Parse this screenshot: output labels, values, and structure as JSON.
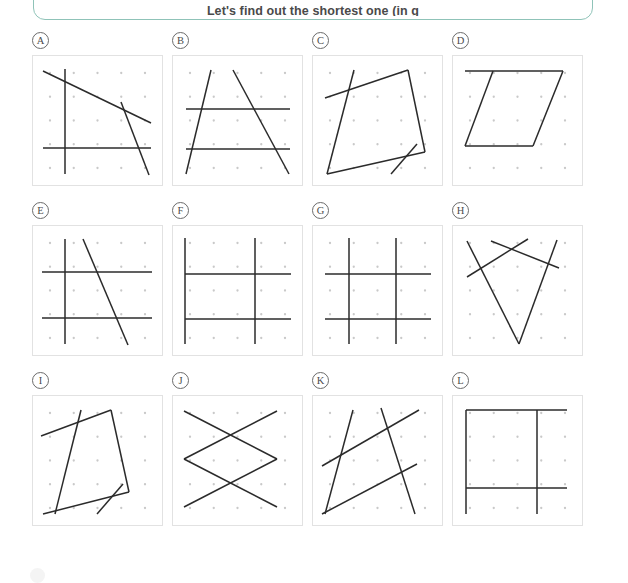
{
  "header": {
    "prompt": "Let's find out the shortest one (in g",
    "border_color": "#8fc3b8"
  },
  "bottom": {
    "marker_name": "page-marker-circle"
  },
  "grid": {
    "columns": 4,
    "rows": 3,
    "dot_rows": 5,
    "dot_cols": 5,
    "dot_color": "#c9c9c9",
    "line_color": "#2b2b2b",
    "panel_border_color": "#e2e2e2"
  },
  "panels": [
    {
      "label": "A",
      "name": "panel-a",
      "segments": [
        [
          10,
          15,
          118,
          67
        ],
        [
          32,
          13,
          32,
          118
        ],
        [
          10,
          92,
          118,
          92
        ],
        [
          88,
          46,
          116,
          119
        ]
      ]
    },
    {
      "label": "B",
      "name": "panel-b",
      "segments": [
        [
          13,
          53,
          117,
          53
        ],
        [
          13,
          93,
          117,
          93
        ],
        [
          38,
          14,
          13,
          118
        ],
        [
          60,
          14,
          116,
          118
        ]
      ]
    },
    {
      "label": "C",
      "name": "panel-c",
      "segments": [
        [
          41,
          14,
          14,
          118
        ],
        [
          14,
          118,
          112,
          96
        ],
        [
          112,
          96,
          95,
          14
        ],
        [
          95,
          14,
          12,
          42
        ],
        [
          78,
          118,
          104,
          88
        ]
      ]
    },
    {
      "label": "D",
      "name": "panel-d",
      "segments": [
        [
          12,
          15,
          110,
          15
        ],
        [
          110,
          15,
          80,
          90
        ],
        [
          80,
          90,
          12,
          90
        ],
        [
          12,
          90,
          40,
          15
        ]
      ]
    },
    {
      "label": "E",
      "name": "panel-e",
      "segments": [
        [
          9,
          46,
          119,
          46
        ],
        [
          9,
          92,
          119,
          92
        ],
        [
          32,
          13,
          32,
          118
        ],
        [
          50,
          13,
          95,
          119
        ]
      ]
    },
    {
      "label": "F",
      "name": "panel-f",
      "segments": [
        [
          12,
          12,
          12,
          118
        ],
        [
          82,
          12,
          82,
          118
        ],
        [
          12,
          48,
          118,
          48
        ],
        [
          12,
          93,
          118,
          93
        ]
      ]
    },
    {
      "label": "G",
      "name": "panel-g",
      "segments": [
        [
          36,
          12,
          36,
          118
        ],
        [
          83,
          12,
          83,
          118
        ],
        [
          12,
          48,
          118,
          48
        ],
        [
          12,
          93,
          118,
          93
        ]
      ]
    },
    {
      "label": "H",
      "name": "panel-h",
      "segments": [
        [
          14,
          15,
          66,
          118
        ],
        [
          66,
          118,
          104,
          14
        ],
        [
          38,
          15,
          106,
          42
        ],
        [
          14,
          51,
          75,
          13
        ]
      ]
    },
    {
      "label": "I",
      "name": "panel-i",
      "segments": [
        [
          48,
          14,
          22,
          118
        ],
        [
          10,
          118,
          96,
          96
        ],
        [
          96,
          96,
          78,
          14
        ],
        [
          78,
          14,
          8,
          40
        ],
        [
          64,
          118,
          90,
          88
        ]
      ]
    },
    {
      "label": "J",
      "name": "panel-j",
      "segments": [
        [
          11,
          15,
          104,
          63
        ],
        [
          104,
          15,
          11,
          63
        ],
        [
          11,
          63,
          104,
          111
        ],
        [
          104,
          63,
          11,
          111
        ]
      ]
    },
    {
      "label": "K",
      "name": "panel-k",
      "segments": [
        [
          40,
          14,
          12,
          118
        ],
        [
          68,
          12,
          102,
          118
        ],
        [
          9,
          70,
          106,
          14
        ],
        [
          9,
          118,
          104,
          68
        ]
      ]
    },
    {
      "label": "L",
      "name": "panel-l",
      "segments": [
        [
          13,
          14,
          13,
          118
        ],
        [
          13,
          14,
          114,
          14
        ],
        [
          84,
          14,
          84,
          118
        ],
        [
          13,
          92,
          114,
          92
        ]
      ]
    }
  ]
}
